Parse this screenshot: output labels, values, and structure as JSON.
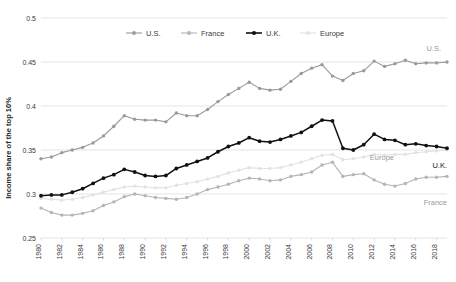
{
  "chart_data": {
    "type": "line",
    "title": "",
    "subtitle": "",
    "xlabel": "",
    "ylabel": "Income share of the top 10%",
    "xlim": [
      1980,
      2019
    ],
    "ylim": [
      0.25,
      0.5
    ],
    "ytick_labels": [
      "0.5",
      "0.45",
      "0.4",
      "0.35",
      "0.3",
      "0.25"
    ],
    "ytick_values": [
      0.5,
      0.45,
      0.4,
      0.35,
      0.3,
      0.25
    ],
    "grid": "horizontal",
    "legend_position": "top-center",
    "x": [
      1980,
      1981,
      1982,
      1983,
      1984,
      1985,
      1986,
      1987,
      1988,
      1989,
      1990,
      1991,
      1992,
      1993,
      1994,
      1995,
      1996,
      1997,
      1998,
      1999,
      2000,
      2001,
      2002,
      2003,
      2004,
      2005,
      2006,
      2007,
      2008,
      2009,
      2010,
      2011,
      2012,
      2013,
      2014,
      2015,
      2016,
      2017,
      2018,
      2019
    ],
    "xtick_labels": [
      "1980",
      "1982",
      "1984",
      "1986",
      "1988",
      "1990",
      "1992",
      "1994",
      "1996",
      "1998",
      "2000",
      "2002",
      "2004",
      "2006",
      "2008",
      "2010",
      "2012",
      "2014",
      "2016",
      "2018"
    ],
    "series": [
      {
        "name": "U.S.",
        "color": "#9a9a9a",
        "marker": "circle",
        "end_label": "U.S.",
        "values": [
          0.34,
          0.342,
          0.347,
          0.35,
          0.353,
          0.358,
          0.366,
          0.377,
          0.389,
          0.385,
          0.384,
          0.384,
          0.382,
          0.392,
          0.389,
          0.389,
          0.396,
          0.405,
          0.413,
          0.42,
          0.427,
          0.42,
          0.418,
          0.419,
          0.428,
          0.437,
          0.443,
          0.447,
          0.434,
          0.429,
          0.437,
          0.44,
          0.451,
          0.445,
          0.448,
          0.452,
          0.448,
          0.449,
          0.449,
          0.45
        ]
      },
      {
        "name": "France",
        "color": "#b5b5b5",
        "marker": "circle",
        "end_label": "France",
        "values": [
          0.284,
          0.279,
          0.276,
          0.276,
          0.278,
          0.281,
          0.287,
          0.291,
          0.297,
          0.3,
          0.298,
          0.296,
          0.295,
          0.294,
          0.296,
          0.3,
          0.305,
          0.308,
          0.311,
          0.315,
          0.318,
          0.317,
          0.315,
          0.316,
          0.32,
          0.322,
          0.325,
          0.333,
          0.336,
          0.32,
          0.322,
          0.323,
          0.316,
          0.311,
          0.309,
          0.312,
          0.317,
          0.319,
          0.319,
          0.32
        ]
      },
      {
        "name": "U.K.",
        "color": "#111111",
        "marker": "circle",
        "end_label": "U.K.",
        "values": [
          0.298,
          0.299,
          0.299,
          0.302,
          0.306,
          0.312,
          0.318,
          0.322,
          0.328,
          0.325,
          0.321,
          0.32,
          0.321,
          0.329,
          0.333,
          0.337,
          0.341,
          0.348,
          0.354,
          0.358,
          0.364,
          0.36,
          0.359,
          0.362,
          0.366,
          0.37,
          0.377,
          0.384,
          0.383,
          0.352,
          0.35,
          0.356,
          0.368,
          0.362,
          0.361,
          0.356,
          0.357,
          0.355,
          0.354,
          0.352
        ]
      },
      {
        "name": "Europe",
        "color": "#e2e2e2",
        "marker": "circle",
        "end_label": "Europe",
        "values": [
          0.295,
          0.294,
          0.293,
          0.294,
          0.296,
          0.299,
          0.302,
          0.305,
          0.308,
          0.309,
          0.308,
          0.307,
          0.307,
          0.31,
          0.312,
          0.314,
          0.317,
          0.32,
          0.324,
          0.327,
          0.33,
          0.329,
          0.329,
          0.33,
          0.333,
          0.336,
          0.34,
          0.344,
          0.345,
          0.339,
          0.34,
          0.342,
          0.345,
          0.344,
          0.345,
          0.345,
          0.347,
          0.348,
          0.349,
          0.35
        ]
      }
    ],
    "annotations": [
      {
        "text": "U.S.",
        "series": "U.S."
      },
      {
        "text": "Europe",
        "series": "Europe"
      },
      {
        "text": "U.K.",
        "series": "U.K."
      },
      {
        "text": "France",
        "series": "France"
      }
    ]
  }
}
